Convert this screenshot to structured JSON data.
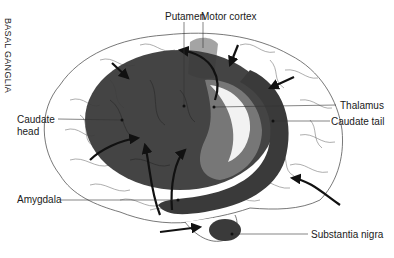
{
  "diagram": {
    "title_vertical": "BASAL GANGLIA",
    "labels": {
      "putamen": "Putamen",
      "motor_cortex": "Motor cortex",
      "caudate_head_line1": "Caudate",
      "caudate_head_line2": "head",
      "thalamus": "Thalamus",
      "caudate_tail": "Caudate tail",
      "amygdala": "Amygdala",
      "substantia_nigra": "Substantia nigra"
    },
    "colors": {
      "basal_ganglia_dark": "#3a3a3a",
      "thalamus_mid": "#7a7a7a",
      "motor_cortex_light": "#9a9a9a",
      "brain_outline": "#555555",
      "background": "#ffffff"
    }
  }
}
